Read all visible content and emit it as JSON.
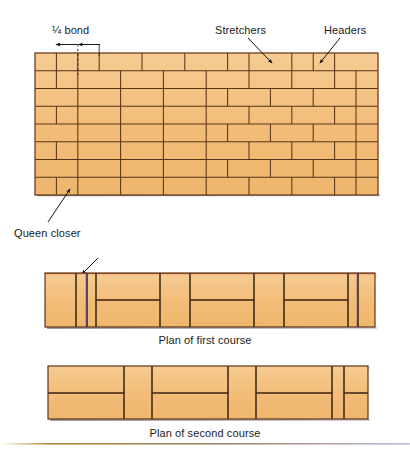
{
  "figure": {
    "background": "#ffffff"
  },
  "colors": {
    "brick_fill": "#f2bc77",
    "brick_fill_light": "#f6cb92",
    "mortar_line": "#5a3418",
    "outline": "#6b3f1d",
    "leader": "#1a1a1a",
    "closer_line": "#3a3fa0",
    "accent_rule_left": "#b08a3c",
    "accent_rule_right": "#c3b8d8",
    "shadow": "#8f8f8f"
  },
  "labels": {
    "quarter_bond": "¼ bond",
    "stretchers": "Stretchers",
    "headers": "Headers",
    "queen_closer": "Queen closer"
  },
  "captions": {
    "first_course": "Plan of first course",
    "second_course": "Plan of second course"
  },
  "elevation": {
    "name": "wall-elevation",
    "x": 35,
    "y": 53,
    "width": 343,
    "height": 142,
    "course_count": 8,
    "course_height": 17.75,
    "courses": [
      {
        "index": 0,
        "type": "header",
        "unit_width": 21.4,
        "offset": 0
      },
      {
        "index": 1,
        "type": "stretcher",
        "unit_width": 42.8,
        "offset": -10.7
      },
      {
        "index": 2,
        "type": "header",
        "unit_width": 21.4,
        "offset": 0
      },
      {
        "index": 3,
        "type": "stretcher",
        "unit_width": 42.8,
        "offset": -10.7
      },
      {
        "index": 4,
        "type": "header",
        "unit_width": 21.4,
        "offset": 0
      },
      {
        "index": 5,
        "type": "stretcher",
        "unit_width": 42.8,
        "offset": -10.7
      },
      {
        "index": 6,
        "type": "header",
        "unit_width": 21.4,
        "offset": 0
      },
      {
        "index": 7,
        "type": "stretcher",
        "unit_width": 42.8,
        "offset": -10.7
      }
    ]
  },
  "plan_first": {
    "name": "plan-first-course",
    "x": 45,
    "y": 272,
    "width": 330,
    "height": 55,
    "closer_x": 62,
    "description": "First course plan: header at each end with queen closer, stretcher pairs between"
  },
  "plan_second": {
    "name": "plan-second-course",
    "x": 48,
    "y": 365,
    "width": 320,
    "height": 55,
    "description": "Second course plan: alternating stretcher pairs and single headers"
  },
  "annotations": {
    "bond_dimension": {
      "y": 44,
      "left_x": 56,
      "mid_x": 78,
      "right_x": 100,
      "tick_from_y": 44,
      "tick_to_y": 75
    },
    "stretchers_leader": {
      "from_x": 250,
      "from_y": 36,
      "to_x": 272,
      "to_y": 62
    },
    "headers_leader": {
      "from_x": 338,
      "from_y": 36,
      "to_x": 320,
      "to_y": 62
    },
    "queen_leader": {
      "from_x": 48,
      "from_y": 222,
      "to_x": 70,
      "to_y": 190
    }
  }
}
